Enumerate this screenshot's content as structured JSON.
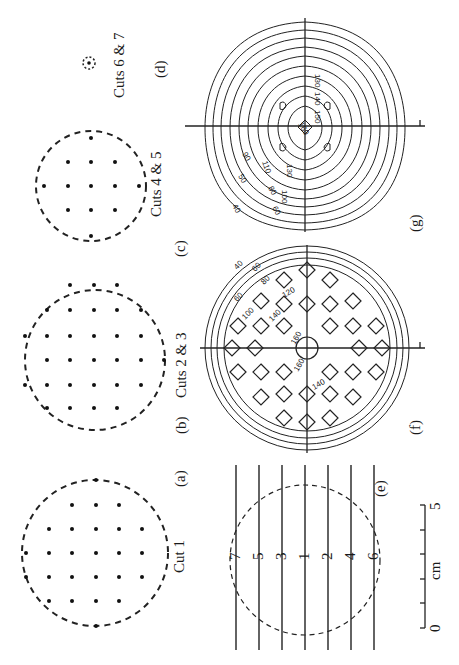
{
  "figure": {
    "orientation": "rotated 90° counter-clockwise",
    "panels": [
      {
        "id": "a",
        "label": "(a)",
        "caption": "Cut 1",
        "type": "dot-pattern",
        "grid": "6x6 with dashed circular outline"
      },
      {
        "id": "b",
        "label": "(b)",
        "caption": "Cuts 2 & 3",
        "type": "dot-pattern",
        "grid": "5x6 with dashed circular outline"
      },
      {
        "id": "c",
        "label": "(c)",
        "caption": "Cuts 4 & 5",
        "type": "dot-pattern",
        "grid": "4x3 with dashed circular outline"
      },
      {
        "id": "d",
        "label": "(d)",
        "caption": "Cuts 6 & 7",
        "type": "dot-pattern",
        "grid": "single small dashed circle"
      },
      {
        "id": "e",
        "label": "(e)",
        "type": "cut-lines",
        "cut_numbers": [
          "7",
          "5",
          "3",
          "1",
          "2",
          "4",
          "6"
        ]
      },
      {
        "id": "f",
        "label": "(f)",
        "type": "contour",
        "contour_labels": [
          "40",
          "60",
          "60",
          "80",
          "100",
          "120",
          "140",
          "140",
          "160",
          "160"
        ]
      },
      {
        "id": "g",
        "label": "(g)",
        "type": "contour",
        "contour_labels": [
          "40",
          "50",
          "60",
          "80",
          "90",
          "100",
          "110",
          "130",
          "130",
          "140",
          "150",
          "160"
        ]
      }
    ],
    "scale_bar": {
      "start": "0",
      "end": "5",
      "unit": "cm",
      "ticks": 5
    }
  }
}
